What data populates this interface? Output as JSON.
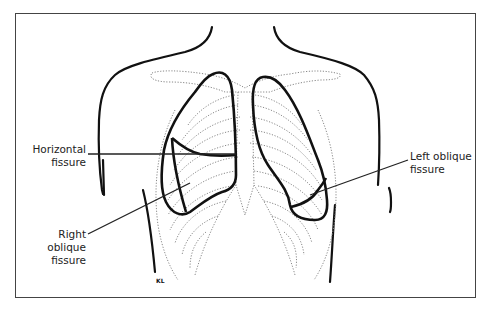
{
  "diagram": {
    "type": "anatomical",
    "labels": {
      "horizontal_fissure": {
        "line1": "Horizontal",
        "line2": "fissure"
      },
      "right_oblique_fissure": {
        "line1": "Right oblique",
        "line2": "fissure"
      },
      "left_oblique_fissure": {
        "line1": "Left oblique",
        "line2": "fissure"
      }
    },
    "artist_initials": "KL"
  },
  "colors": {
    "outline": "#111111",
    "ribs_dotted": "#888888",
    "leader_line": "#222222",
    "frame": "#444444"
  }
}
